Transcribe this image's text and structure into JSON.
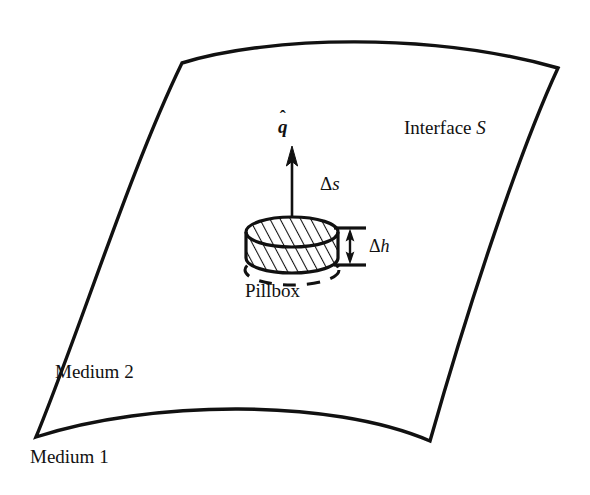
{
  "figure": {
    "background_color": "#ffffff",
    "line_color": "#111111",
    "width": 590,
    "height": 495
  },
  "labels": {
    "interface": "Interface ",
    "interface_symbol": "S",
    "medium_upper": "Medium 2",
    "medium_lower": "Medium 1",
    "pillbox": "Pillbox",
    "normal_vector_letter": "q",
    "normal_vector_hat": "ˆ",
    "delta_s": "Δ",
    "delta_s_symbol": "s",
    "delta_h": "Δ",
    "delta_h_symbol": "h"
  },
  "geometry": {
    "surface_corners": {
      "top_left": [
        182,
        63
      ],
      "top_right": [
        558,
        68
      ],
      "bottom_right": [
        430,
        441
      ],
      "bottom_left": [
        36,
        437
      ]
    },
    "surface_edges": {
      "top": "bows upward",
      "right": "bows left (concave)",
      "bottom": "bows upward (concave)",
      "left": "bows left (convex outward)"
    },
    "pillbox": {
      "center": [
        292,
        232
      ],
      "radius_x": 46,
      "radius_y": 15,
      "height": 26,
      "dashed_shadow_offset_y": 31,
      "hatched": true
    },
    "normal_arrow": {
      "from": [
        292,
        232
      ],
      "to": [
        292,
        150
      ]
    },
    "delta_h_dimension": {
      "tick_top_y": 228,
      "tick_bottom_y": 265,
      "x_center": 350,
      "tick_half_width": 16
    }
  }
}
